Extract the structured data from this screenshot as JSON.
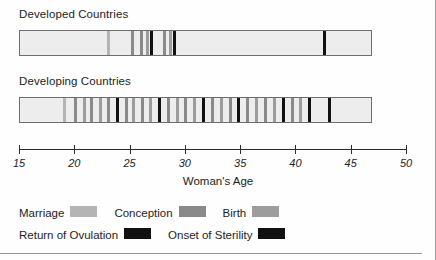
{
  "figure": {
    "axis_title": "Woman's Age",
    "panels": [
      {
        "title": "Developed Countries"
      },
      {
        "title": "Developing Countries"
      }
    ]
  },
  "axis": {
    "min": 15,
    "max": 50,
    "ticks": [
      15,
      20,
      25,
      30,
      35,
      40,
      45,
      50
    ],
    "tick_labels": [
      "15",
      "20",
      "25",
      "30",
      "35",
      "40",
      "45",
      "50"
    ]
  },
  "colors": {
    "marriage": "#b4b4b4",
    "conception": "#8a8a8a",
    "birth": "#9d9d9d",
    "return_of_ovulation": "#111111",
    "onset_of_sterility": "#111111",
    "bar_fill": "#ededed",
    "bar_border": "#6e6e6e",
    "axis": "#2b2b2b",
    "text": "#1d1d1d"
  },
  "legend": {
    "rows": [
      [
        {
          "label": "Marriage",
          "color_key": "marriage"
        },
        {
          "label": "Conception",
          "color_key": "conception"
        },
        {
          "label": "Birth",
          "color_key": "birth"
        }
      ],
      [
        {
          "label": "Return of Ovulation",
          "color_key": "return_of_ovulation"
        },
        {
          "label": "Onset of Sterility",
          "color_key": "onset_of_sterility"
        }
      ]
    ]
  },
  "chart_data": {
    "type": "bar",
    "xlabel": "Woman's Age",
    "ylabel": "",
    "xlim": [
      15,
      50
    ],
    "grid": false,
    "legend_position": "bottom-left",
    "categories": [
      "Developed Countries",
      "Developing Countries"
    ],
    "series": [
      {
        "name": "Developed Countries",
        "events": [
          {
            "age": 23.0,
            "type": "marriage"
          },
          {
            "age": 25.2,
            "type": "conception"
          },
          {
            "age": 26.0,
            "type": "conception"
          },
          {
            "age": 26.5,
            "type": "birth"
          },
          {
            "age": 26.9,
            "type": "return_of_ovulation"
          },
          {
            "age": 28.1,
            "type": "conception"
          },
          {
            "age": 28.6,
            "type": "birth"
          },
          {
            "age": 29.0,
            "type": "return_of_ovulation"
          },
          {
            "age": 42.5,
            "type": "onset_of_sterility"
          }
        ]
      },
      {
        "name": "Developing Countries",
        "events": [
          {
            "age": 19.0,
            "type": "marriage"
          },
          {
            "age": 20.0,
            "type": "conception"
          },
          {
            "age": 20.8,
            "type": "birth"
          },
          {
            "age": 21.5,
            "type": "conception"
          },
          {
            "age": 22.3,
            "type": "birth"
          },
          {
            "age": 23.0,
            "type": "conception"
          },
          {
            "age": 23.8,
            "type": "return_of_ovulation"
          },
          {
            "age": 24.6,
            "type": "conception"
          },
          {
            "age": 25.3,
            "type": "birth"
          },
          {
            "age": 26.1,
            "type": "conception"
          },
          {
            "age": 26.8,
            "type": "birth"
          },
          {
            "age": 27.6,
            "type": "return_of_ovulation"
          },
          {
            "age": 28.4,
            "type": "conception"
          },
          {
            "age": 29.2,
            "type": "birth"
          },
          {
            "age": 30.0,
            "type": "conception"
          },
          {
            "age": 30.8,
            "type": "birth"
          },
          {
            "age": 31.6,
            "type": "return_of_ovulation"
          },
          {
            "age": 32.4,
            "type": "conception"
          },
          {
            "age": 33.2,
            "type": "birth"
          },
          {
            "age": 34.0,
            "type": "conception"
          },
          {
            "age": 34.8,
            "type": "return_of_ovulation"
          },
          {
            "age": 35.6,
            "type": "conception"
          },
          {
            "age": 36.4,
            "type": "birth"
          },
          {
            "age": 37.2,
            "type": "conception"
          },
          {
            "age": 38.0,
            "type": "birth"
          },
          {
            "age": 38.8,
            "type": "return_of_ovulation"
          },
          {
            "age": 39.6,
            "type": "conception"
          },
          {
            "age": 40.4,
            "type": "birth"
          },
          {
            "age": 41.2,
            "type": "return_of_ovulation"
          },
          {
            "age": 43.0,
            "type": "onset_of_sterility"
          }
        ]
      }
    ]
  }
}
